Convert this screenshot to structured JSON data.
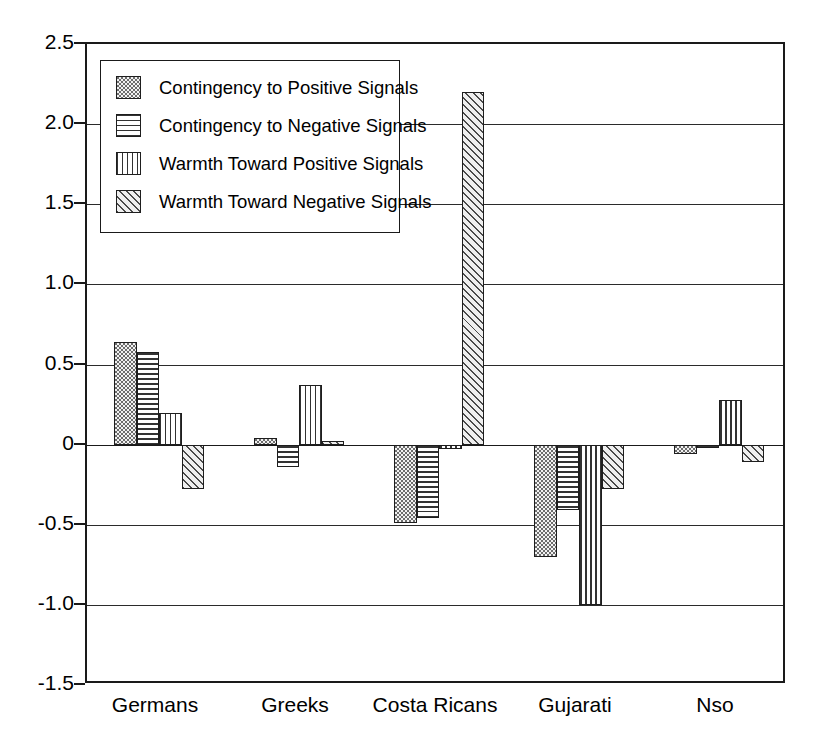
{
  "chart_data": {
    "type": "bar",
    "title": "",
    "xlabel": "",
    "ylabel": "",
    "ylim": [
      -1.5,
      2.5
    ],
    "ytick_labels": [
      "2.5",
      "2.0",
      "1.5",
      "1.0",
      "0.5",
      "0",
      "-0.5",
      "-1.0",
      "-1.5"
    ],
    "ytick_values": [
      2.5,
      2.0,
      1.5,
      1.0,
      0.5,
      0,
      -0.5,
      -1.0,
      -1.5
    ],
    "grid": true,
    "legend_position": "upper-left-inside",
    "categories": [
      "Germans",
      "Greeks",
      "Costa Ricans",
      "Gujarati",
      "Nso"
    ],
    "series": [
      {
        "name": "Contingency to Positive Signals",
        "pattern": "dots",
        "values": [
          0.64,
          0.04,
          -0.49,
          -0.7,
          -0.06
        ]
      },
      {
        "name": "Contingency to Negative Signals",
        "pattern": "horizontal-lines",
        "values": [
          0.58,
          -0.14,
          -0.46,
          -0.41,
          -0.02
        ]
      },
      {
        "name": "Warmth Toward Positive Signals",
        "pattern": "vertical-lines",
        "values": [
          0.2,
          0.37,
          -0.03,
          -1.0,
          0.28
        ]
      },
      {
        "name": "Warmth Toward Negative Signals",
        "pattern": "diagonal-lines",
        "values": [
          -0.28,
          0.02,
          2.2,
          -0.28,
          -0.11
        ]
      }
    ]
  }
}
